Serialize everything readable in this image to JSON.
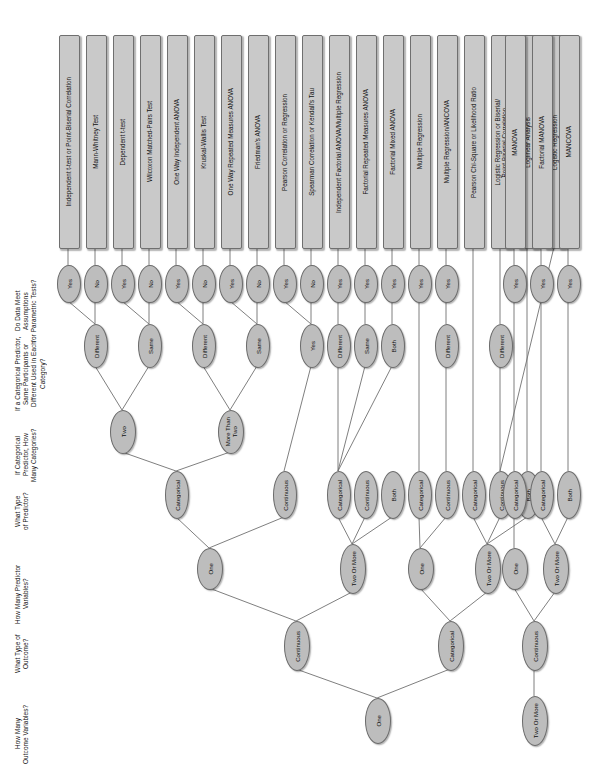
{
  "diagram": {
    "orientation": "rotated-90",
    "colors": {
      "node_fill": "#bdbdbd",
      "box_fill": "#c9c9c9",
      "stroke": "#6b6b6b",
      "line": "#707070",
      "text": "#111111",
      "background": "#ffffff"
    }
  },
  "row_labels": [
    {
      "id": "r-assumptions",
      "text": "Do Data Meet\nAssumptions\nfor Parametric Tests?",
      "x": 14,
      "y": 252,
      "h": 118
    },
    {
      "id": "r-same-diff",
      "text": "If a Categorical Predictor,\nSame Participants or\nDifferent Used in Each\nCategory?",
      "x": 14,
      "y": 310,
      "h": 128
    },
    {
      "id": "r-categories",
      "text": "If Categorical\nPredictor, How\nMany Categories?",
      "x": 14,
      "y": 400,
      "h": 110
    },
    {
      "id": "r-predictor-type",
      "text": "What Type\nof Predictor?",
      "x": 14,
      "y": 468,
      "h": 86
    },
    {
      "id": "r-num-predictors",
      "text": "How Many Predictor\nVariables?",
      "x": 14,
      "y": 540,
      "h": 108
    },
    {
      "id": "r-outcome-type",
      "text": "What Type of\nOutcome?",
      "x": 14,
      "y": 612,
      "h": 84
    },
    {
      "id": "r-num-outcomes",
      "text": "How Many\nOutcome Variables?",
      "x": 14,
      "y": 682,
      "h": 104
    }
  ],
  "tests": [
    {
      "id": "t1",
      "label": "Independent t-test or Point-Biserial Correlation",
      "cx": 68
    },
    {
      "id": "t2",
      "label": "Mann-Whitney Test",
      "cx": 95
    },
    {
      "id": "t3",
      "label": "Dependent t-test",
      "cx": 122
    },
    {
      "id": "t4",
      "label": "Wilcoxon Matched-Pairs Test",
      "cx": 149
    },
    {
      "id": "t5",
      "label": "One Way Independent ANOVA",
      "cx": 176
    },
    {
      "id": "t6",
      "label": "Kruskal-Wallis Test",
      "cx": 203
    },
    {
      "id": "t7",
      "label": "One Way Repeated Measures ANOVA",
      "cx": 230
    },
    {
      "id": "t8",
      "label": "Friedman's ANOVA",
      "cx": 257
    },
    {
      "id": "t9",
      "label": "Pearson Correlation or Regression",
      "cx": 284
    },
    {
      "id": "t10",
      "label": "Spearman Correlation or Kendall's Tau",
      "cx": 311
    },
    {
      "id": "t11",
      "label": "Independent Factorial ANOVA/Multiple Regression",
      "cx": 338
    },
    {
      "id": "t12",
      "label": "Factorial Repeated Measures ANOVA",
      "cx": 365
    },
    {
      "id": "t13",
      "label": "Factorial Mixed ANOVA",
      "cx": 392
    },
    {
      "id": "t14",
      "label": "Multiple Regression",
      "cx": 419
    },
    {
      "id": "t15",
      "label": "Multiple Regression/ANCOVA",
      "cx": 446
    },
    {
      "id": "t16",
      "label": "Pearson Chi-Square or Likelihood Ratio",
      "cx": 473
    },
    {
      "id": "t17",
      "label": "Logistic Regression or Biserial/\nPoint-Biserial Correlation",
      "cx": 500
    },
    {
      "id": "t18",
      "label": "Loglinear Analysis",
      "cx": 527
    },
    {
      "id": "t19",
      "label": "Logistic Regression",
      "cx": 554
    },
    {
      "id": "t20",
      "label": "MANOVA",
      "cx": 514
    },
    {
      "id": "t21",
      "label": "Factorial MANOVA",
      "cx": 541
    },
    {
      "id": "t22",
      "label": "MANCOVA",
      "cx": 568
    }
  ],
  "test_box_geometry": {
    "top": 35,
    "height": 212,
    "width": 19
  },
  "nodes": [
    {
      "id": "n-a1",
      "label": "Yes",
      "cx": 68,
      "cy": 283,
      "rx": 11,
      "ry": 18
    },
    {
      "id": "n-a2",
      "label": "No",
      "cx": 95,
      "cy": 283,
      "rx": 11,
      "ry": 18
    },
    {
      "id": "n-a3",
      "label": "Yes",
      "cx": 122,
      "cy": 283,
      "rx": 11,
      "ry": 18
    },
    {
      "id": "n-a4",
      "label": "No",
      "cx": 149,
      "cy": 283,
      "rx": 11,
      "ry": 18
    },
    {
      "id": "n-a5",
      "label": "Yes",
      "cx": 176,
      "cy": 283,
      "rx": 11,
      "ry": 18
    },
    {
      "id": "n-a6",
      "label": "No",
      "cx": 203,
      "cy": 283,
      "rx": 11,
      "ry": 18
    },
    {
      "id": "n-a7",
      "label": "Yes",
      "cx": 230,
      "cy": 283,
      "rx": 11,
      "ry": 18
    },
    {
      "id": "n-a8",
      "label": "No",
      "cx": 257,
      "cy": 283,
      "rx": 11,
      "ry": 18
    },
    {
      "id": "n-a9",
      "label": "Yes",
      "cx": 284,
      "cy": 283,
      "rx": 11,
      "ry": 18
    },
    {
      "id": "n-a10",
      "label": "No",
      "cx": 311,
      "cy": 283,
      "rx": 11,
      "ry": 18
    },
    {
      "id": "n-a11",
      "label": "Yes",
      "cx": 338,
      "cy": 283,
      "rx": 11,
      "ry": 18
    },
    {
      "id": "n-a12",
      "label": "Yes",
      "cx": 365,
      "cy": 283,
      "rx": 11,
      "ry": 18
    },
    {
      "id": "n-a13",
      "label": "Yes",
      "cx": 392,
      "cy": 283,
      "rx": 11,
      "ry": 18
    },
    {
      "id": "n-a14",
      "label": "Yes",
      "cx": 419,
      "cy": 283,
      "rx": 11,
      "ry": 18
    },
    {
      "id": "n-a15",
      "label": "Yes",
      "cx": 446,
      "cy": 283,
      "rx": 11,
      "ry": 18
    },
    {
      "id": "n-a20",
      "label": "Yes",
      "cx": 514,
      "cy": 283,
      "rx": 11,
      "ry": 18
    },
    {
      "id": "n-a21",
      "label": "Yes",
      "cx": 541,
      "cy": 283,
      "rx": 11,
      "ry": 18
    },
    {
      "id": "n-a22",
      "label": "Yes",
      "cx": 568,
      "cy": 283,
      "rx": 11,
      "ry": 18
    },
    {
      "id": "n-d1",
      "label": "Different",
      "cx": 95,
      "cy": 345,
      "rx": 11,
      "ry": 21
    },
    {
      "id": "n-d2",
      "label": "Same",
      "cx": 149,
      "cy": 345,
      "rx": 11,
      "ry": 21
    },
    {
      "id": "n-d3",
      "label": "Different",
      "cx": 203,
      "cy": 345,
      "rx": 11,
      "ry": 21
    },
    {
      "id": "n-d4",
      "label": "Same",
      "cx": 257,
      "cy": 345,
      "rx": 11,
      "ry": 21
    },
    {
      "id": "n-d5",
      "label": "Yes",
      "cx": 311,
      "cy": 345,
      "rx": 11,
      "ry": 21
    },
    {
      "id": "n-d6",
      "label": "Different",
      "cx": 338,
      "cy": 345,
      "rx": 11,
      "ry": 21
    },
    {
      "id": "n-d7",
      "label": "Same",
      "cx": 365,
      "cy": 345,
      "rx": 11,
      "ry": 21
    },
    {
      "id": "n-d8",
      "label": "Both",
      "cx": 392,
      "cy": 345,
      "rx": 11,
      "ry": 21
    },
    {
      "id": "n-d9",
      "label": "Different",
      "cx": 446,
      "cy": 345,
      "rx": 11,
      "ry": 21
    },
    {
      "id": "n-d10",
      "label": "Different",
      "cx": 500,
      "cy": 345,
      "rx": 11,
      "ry": 21
    },
    {
      "id": "n-c1",
      "label": "Two",
      "cx": 122,
      "cy": 431,
      "rx": 12,
      "ry": 21
    },
    {
      "id": "n-c2",
      "label": "More Than\nTwo",
      "cx": 230,
      "cy": 431,
      "rx": 12,
      "ry": 21
    },
    {
      "id": "n-p1",
      "label": "Categorical",
      "cx": 176,
      "cy": 494,
      "rx": 11,
      "ry": 23
    },
    {
      "id": "n-p2",
      "label": "Continuous",
      "cx": 284,
      "cy": 494,
      "rx": 11,
      "ry": 23
    },
    {
      "id": "n-p3",
      "label": "Categorical",
      "cx": 338,
      "cy": 494,
      "rx": 11,
      "ry": 23
    },
    {
      "id": "n-p4",
      "label": "Continuous",
      "cx": 365,
      "cy": 494,
      "rx": 11,
      "ry": 23
    },
    {
      "id": "n-p5",
      "label": "Both",
      "cx": 392,
      "cy": 494,
      "rx": 11,
      "ry": 23
    },
    {
      "id": "n-p6",
      "label": "Categorical",
      "cx": 419,
      "cy": 494,
      "rx": 11,
      "ry": 23
    },
    {
      "id": "n-p7",
      "label": "Continuous",
      "cx": 446,
      "cy": 494,
      "rx": 11,
      "ry": 23
    },
    {
      "id": "n-p8",
      "label": "Categorical",
      "cx": 473,
      "cy": 494,
      "rx": 11,
      "ry": 23
    },
    {
      "id": "n-p9",
      "label": "Continuous",
      "cx": 500,
      "cy": 494,
      "rx": 11,
      "ry": 23
    },
    {
      "id": "n-p10",
      "label": "Both",
      "cx": 527,
      "cy": 494,
      "rx": 11,
      "ry": 23
    },
    {
      "id": "n-p11",
      "label": "Categorical",
      "cx": 514,
      "cy": 494,
      "rx": 11,
      "ry": 23
    },
    {
      "id": "n-p12",
      "label": "Categorical",
      "cx": 541,
      "cy": 494,
      "rx": 11,
      "ry": 23
    },
    {
      "id": "n-p13",
      "label": "Both",
      "cx": 568,
      "cy": 494,
      "rx": 11,
      "ry": 23
    },
    {
      "id": "n-v1",
      "label": "One",
      "cx": 209,
      "cy": 568,
      "rx": 12,
      "ry": 20
    },
    {
      "id": "n-v2",
      "label": "Two Or More",
      "cx": 352,
      "cy": 568,
      "rx": 12,
      "ry": 24
    },
    {
      "id": "n-v3",
      "label": "One",
      "cx": 420,
      "cy": 568,
      "rx": 12,
      "ry": 20
    },
    {
      "id": "n-v4",
      "label": "Two Or More",
      "cx": 487,
      "cy": 568,
      "rx": 12,
      "ry": 24
    },
    {
      "id": "n-v5",
      "label": "One",
      "cx": 514,
      "cy": 568,
      "rx": 12,
      "ry": 20
    },
    {
      "id": "n-v6",
      "label": "Two Or More",
      "cx": 555,
      "cy": 568,
      "rx": 12,
      "ry": 24
    },
    {
      "id": "n-o1",
      "label": "Continuous",
      "cx": 296,
      "cy": 645,
      "rx": 12,
      "ry": 24
    },
    {
      "id": "n-o2",
      "label": "Categorical",
      "cx": 450,
      "cy": 645,
      "rx": 12,
      "ry": 24
    },
    {
      "id": "n-o3",
      "label": "Continuous",
      "cx": 534,
      "cy": 645,
      "rx": 12,
      "ry": 24
    },
    {
      "id": "n-s1",
      "label": "One",
      "cx": 377,
      "cy": 720,
      "rx": 12,
      "ry": 22
    },
    {
      "id": "n-s2",
      "label": "Two Or More",
      "cx": 534,
      "cy": 720,
      "rx": 12,
      "ry": 24
    }
  ],
  "edges": [
    {
      "from": "t1",
      "to": "n-a1"
    },
    {
      "from": "t2",
      "to": "n-a2"
    },
    {
      "from": "t3",
      "to": "n-a3"
    },
    {
      "from": "t4",
      "to": "n-a4"
    },
    {
      "from": "t5",
      "to": "n-a5"
    },
    {
      "from": "t6",
      "to": "n-a6"
    },
    {
      "from": "t7",
      "to": "n-a7"
    },
    {
      "from": "t8",
      "to": "n-a8"
    },
    {
      "from": "t9",
      "to": "n-a9"
    },
    {
      "from": "t10",
      "to": "n-a10"
    },
    {
      "from": "t11",
      "to": "n-a11"
    },
    {
      "from": "t12",
      "to": "n-a12"
    },
    {
      "from": "t13",
      "to": "n-a13"
    },
    {
      "from": "t14",
      "to": "n-a14"
    },
    {
      "from": "t15",
      "to": "n-a15"
    },
    {
      "from": "t16",
      "to": "n-p8"
    },
    {
      "from": "t17",
      "to": "n-d10"
    },
    {
      "from": "t18",
      "to": "n-p10"
    },
    {
      "from": "t19",
      "to": "n-p9"
    },
    {
      "from": "t20",
      "to": "n-a20"
    },
    {
      "from": "t21",
      "to": "n-a21"
    },
    {
      "from": "t22",
      "to": "n-a22"
    },
    {
      "from": "n-a1",
      "to": "n-d1"
    },
    {
      "from": "n-a2",
      "to": "n-d1"
    },
    {
      "from": "n-a3",
      "to": "n-d2"
    },
    {
      "from": "n-a4",
      "to": "n-d2"
    },
    {
      "from": "n-a5",
      "to": "n-d3"
    },
    {
      "from": "n-a6",
      "to": "n-d3"
    },
    {
      "from": "n-a7",
      "to": "n-d4"
    },
    {
      "from": "n-a8",
      "to": "n-d4"
    },
    {
      "from": "n-a9",
      "to": "n-d5"
    },
    {
      "from": "n-a10",
      "to": "n-d5"
    },
    {
      "from": "n-a11",
      "to": "n-d6"
    },
    {
      "from": "n-a12",
      "to": "n-d7"
    },
    {
      "from": "n-a13",
      "to": "n-d8"
    },
    {
      "from": "n-a14",
      "to": "n-p6"
    },
    {
      "from": "n-a15",
      "to": "n-d9"
    },
    {
      "from": "n-a20",
      "to": "n-p11"
    },
    {
      "from": "n-a21",
      "to": "n-p12"
    },
    {
      "from": "n-a22",
      "to": "n-p13"
    },
    {
      "from": "n-d1",
      "to": "n-c1"
    },
    {
      "from": "n-d2",
      "to": "n-c1"
    },
    {
      "from": "n-d3",
      "to": "n-c2"
    },
    {
      "from": "n-d4",
      "to": "n-c2"
    },
    {
      "from": "n-d5",
      "to": "n-p2"
    },
    {
      "from": "n-d6",
      "to": "n-p3"
    },
    {
      "from": "n-d7",
      "to": "n-p3"
    },
    {
      "from": "n-d8",
      "to": "n-p3"
    },
    {
      "from": "n-d9",
      "to": "n-p7"
    },
    {
      "from": "n-d10",
      "to": "n-p9"
    },
    {
      "from": "n-c1",
      "to": "n-p1"
    },
    {
      "from": "n-c2",
      "to": "n-p1"
    },
    {
      "from": "n-p1",
      "to": "n-v1"
    },
    {
      "from": "n-p2",
      "to": "n-v1"
    },
    {
      "from": "n-p3",
      "to": "n-v2"
    },
    {
      "from": "n-p4",
      "to": "n-v2"
    },
    {
      "from": "n-p5",
      "to": "n-v2"
    },
    {
      "from": "n-p6",
      "to": "n-v3"
    },
    {
      "from": "n-p7",
      "to": "n-v3"
    },
    {
      "from": "n-p8",
      "to": "n-v4"
    },
    {
      "from": "n-p9",
      "to": "n-v4"
    },
    {
      "from": "n-p10",
      "to": "n-v4"
    },
    {
      "from": "n-p11",
      "to": "n-v5"
    },
    {
      "from": "n-p12",
      "to": "n-v6"
    },
    {
      "from": "n-p13",
      "to": "n-v6"
    },
    {
      "from": "n-v1",
      "to": "n-o1"
    },
    {
      "from": "n-v2",
      "to": "n-o1"
    },
    {
      "from": "n-v3",
      "to": "n-o2"
    },
    {
      "from": "n-v4",
      "to": "n-o2"
    },
    {
      "from": "n-v5",
      "to": "n-o3"
    },
    {
      "from": "n-v6",
      "to": "n-o3"
    },
    {
      "from": "n-o1",
      "to": "n-s1"
    },
    {
      "from": "n-o2",
      "to": "n-s1"
    },
    {
      "from": "n-o3",
      "to": "n-s2"
    }
  ]
}
